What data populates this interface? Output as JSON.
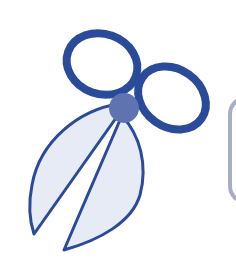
{
  "illustration": {
    "subject": "scissors",
    "colors": {
      "outline": "#2a4a9a",
      "blade_fill": "#e6ebf5",
      "pivot": "#5f73b0",
      "panel_edge": "#a9aec8",
      "background": "#ffffff"
    }
  },
  "icons": [
    "scissors-icon"
  ]
}
